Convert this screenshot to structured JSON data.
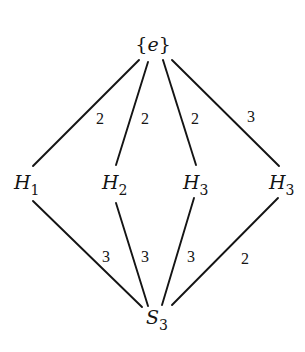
{
  "diagram": {
    "nodes": {
      "top": {
        "label_open": "{",
        "label_var": "e",
        "label_close": "}"
      },
      "h1": {
        "base": "H",
        "sub": "1"
      },
      "h2": {
        "base": "H",
        "sub": "2"
      },
      "h3a": {
        "base": "H",
        "sub": "3"
      },
      "h3b": {
        "base": "H",
        "sub": "3"
      },
      "bottom": {
        "base": "S",
        "sub": "3"
      }
    },
    "edges_upper": [
      {
        "from": "{e}",
        "to": "H1",
        "label": "2"
      },
      {
        "from": "{e}",
        "to": "H2",
        "label": "2"
      },
      {
        "from": "{e}",
        "to": "H3",
        "label": "2"
      },
      {
        "from": "{e}",
        "to": "H3",
        "label": "3"
      }
    ],
    "edges_lower": [
      {
        "from": "H1",
        "to": "S3",
        "label": "3"
      },
      {
        "from": "H2",
        "to": "S3",
        "label": "3"
      },
      {
        "from": "H3",
        "to": "S3",
        "label": "3"
      },
      {
        "from": "H3",
        "to": "S3",
        "label": "2"
      }
    ],
    "colors": {
      "ink": "#141414",
      "background": "#ffffff"
    }
  }
}
